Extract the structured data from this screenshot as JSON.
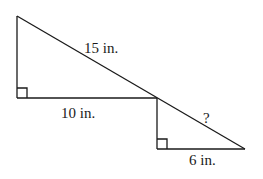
{
  "diagram": {
    "type": "geometry",
    "labels": {
      "big_hypotenuse": "15 in.",
      "big_base": "10 in.",
      "small_hypotenuse": "?",
      "small_base": "6 in."
    },
    "colors": {
      "stroke": "#1a1a1a",
      "background": "#ffffff"
    }
  }
}
